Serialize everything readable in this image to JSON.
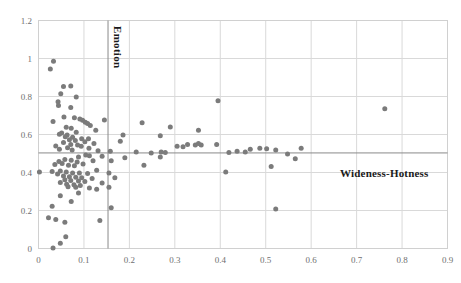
{
  "chart_data": {
    "type": "scatter",
    "title": "",
    "subtitle": "",
    "xlabel": "",
    "ylabel": "",
    "xlim": [
      0,
      0.9
    ],
    "ylim": [
      0,
      1.2
    ],
    "xticks": [
      "0",
      "0.1",
      "0.2",
      "0.3",
      "0.4",
      "0.5",
      "0.6",
      "0.7",
      "0.8",
      "0.9"
    ],
    "xtick_values": [
      0,
      0.1,
      0.2,
      0.3,
      0.4,
      0.5,
      0.6,
      0.7,
      0.8,
      0.9
    ],
    "yticks": [
      "0",
      "0.2",
      "0.4",
      "0.6",
      "0.8",
      "1",
      "1.2"
    ],
    "ytick_values": [
      0,
      0.2,
      0.4,
      0.6,
      0.8,
      1.0,
      1.2
    ],
    "grid": true,
    "legend": false,
    "marker": {
      "shape": "circle",
      "color": "#7b7b7b",
      "size_px": 5
    },
    "annotations": [
      {
        "name": "emotion",
        "text": "Emotion",
        "orientation": "vertical",
        "line": {
          "type": "vline",
          "x": 0.153,
          "color": "#8a8a8a"
        }
      },
      {
        "name": "wideness-hotness",
        "text": "Wideness-Hotness",
        "orientation": "horizontal",
        "line": {
          "type": "hline",
          "y": 0.503,
          "color": "#8a8a8a"
        }
      }
    ],
    "series": [
      {
        "name": "data",
        "points": [
          [
            0.033,
            0.985
          ],
          [
            0.026,
            0.945
          ],
          [
            0.055,
            0.852
          ],
          [
            0.071,
            0.855
          ],
          [
            0.049,
            0.815
          ],
          [
            0.083,
            0.798
          ],
          [
            0.043,
            0.772
          ],
          [
            0.044,
            0.752
          ],
          [
            0.071,
            0.742
          ],
          [
            0.762,
            0.735
          ],
          [
            0.056,
            0.692
          ],
          [
            0.079,
            0.688
          ],
          [
            0.091,
            0.682
          ],
          [
            0.097,
            0.675
          ],
          [
            0.032,
            0.668
          ],
          [
            0.103,
            0.665
          ],
          [
            0.145,
            0.676
          ],
          [
            0.108,
            0.658
          ],
          [
            0.228,
            0.662
          ],
          [
            0.114,
            0.648
          ],
          [
            0.395,
            0.778
          ],
          [
            0.061,
            0.638
          ],
          [
            0.072,
            0.633
          ],
          [
            0.29,
            0.64
          ],
          [
            0.352,
            0.622
          ],
          [
            0.126,
            0.622
          ],
          [
            0.083,
            0.612
          ],
          [
            0.051,
            0.608
          ],
          [
            0.046,
            0.601
          ],
          [
            0.063,
            0.598
          ],
          [
            0.186,
            0.598
          ],
          [
            0.268,
            0.593
          ],
          [
            0.059,
            0.588
          ],
          [
            0.075,
            0.585
          ],
          [
            0.095,
            0.578
          ],
          [
            0.11,
            0.578
          ],
          [
            0.068,
            0.572
          ],
          [
            0.081,
            0.568
          ],
          [
            0.18,
            0.565
          ],
          [
            0.102,
            0.562
          ],
          [
            0.055,
            0.558
          ],
          [
            0.122,
            0.552
          ],
          [
            0.071,
            0.548
          ],
          [
            0.086,
            0.545
          ],
          [
            0.038,
            0.54
          ],
          [
            0.094,
            0.538
          ],
          [
            0.064,
            0.53
          ],
          [
            0.111,
            0.528
          ],
          [
            0.328,
            0.548
          ],
          [
            0.345,
            0.545
          ],
          [
            0.352,
            0.552
          ],
          [
            0.358,
            0.545
          ],
          [
            0.392,
            0.548
          ],
          [
            0.305,
            0.538
          ],
          [
            0.318,
            0.535
          ],
          [
            0.046,
            0.522
          ],
          [
            0.074,
            0.518
          ],
          [
            0.131,
            0.515
          ],
          [
            0.158,
            0.512
          ],
          [
            0.27,
            0.508
          ],
          [
            0.279,
            0.505
          ],
          [
            0.215,
            0.508
          ],
          [
            0.248,
            0.502
          ],
          [
            0.419,
            0.505
          ],
          [
            0.437,
            0.512
          ],
          [
            0.466,
            0.522
          ],
          [
            0.487,
            0.528
          ],
          [
            0.502,
            0.525
          ],
          [
            0.522,
            0.518
          ],
          [
            0.455,
            0.508
          ],
          [
            0.578,
            0.528
          ],
          [
            0.548,
            0.498
          ],
          [
            0.104,
            0.492
          ],
          [
            0.112,
            0.488
          ],
          [
            0.088,
            0.482
          ],
          [
            0.14,
            0.485
          ],
          [
            0.19,
            0.478
          ],
          [
            0.268,
            0.482
          ],
          [
            0.058,
            0.468
          ],
          [
            0.072,
            0.465
          ],
          [
            0.12,
            0.462
          ],
          [
            0.045,
            0.458
          ],
          [
            0.085,
            0.455
          ],
          [
            0.16,
            0.462
          ],
          [
            0.565,
            0.472
          ],
          [
            0.052,
            0.448
          ],
          [
            0.098,
            0.445
          ],
          [
            0.036,
            0.442
          ],
          [
            0.066,
            0.438
          ],
          [
            0.079,
            0.435
          ],
          [
            0.232,
            0.438
          ],
          [
            0.002,
            0.402
          ],
          [
            0.03,
            0.405
          ],
          [
            0.048,
            0.408
          ],
          [
            0.061,
            0.402
          ],
          [
            0.075,
            0.398
          ],
          [
            0.09,
            0.398
          ],
          [
            0.042,
            0.392
          ],
          [
            0.108,
            0.395
          ],
          [
            0.128,
            0.412
          ],
          [
            0.155,
            0.398
          ],
          [
            0.412,
            0.402
          ],
          [
            0.512,
            0.432
          ],
          [
            0.055,
            0.382
          ],
          [
            0.068,
            0.378
          ],
          [
            0.082,
            0.375
          ],
          [
            0.095,
            0.372
          ],
          [
            0.118,
            0.368
          ],
          [
            0.168,
            0.372
          ],
          [
            0.058,
            0.362
          ],
          [
            0.071,
            0.358
          ],
          [
            0.088,
            0.355
          ],
          [
            0.102,
            0.352
          ],
          [
            0.048,
            0.348
          ],
          [
            0.14,
            0.345
          ],
          [
            0.062,
            0.338
          ],
          [
            0.078,
            0.335
          ],
          [
            0.092,
            0.332
          ],
          [
            0.065,
            0.325
          ],
          [
            0.082,
            0.322
          ],
          [
            0.112,
            0.318
          ],
          [
            0.155,
            0.322
          ],
          [
            0.128,
            0.312
          ],
          [
            0.088,
            0.292
          ],
          [
            0.048,
            0.278
          ],
          [
            0.072,
            0.248
          ],
          [
            0.16,
            0.215
          ],
          [
            0.522,
            0.208
          ],
          [
            0.03,
            0.222
          ],
          [
            0.022,
            0.162
          ],
          [
            0.038,
            0.152
          ],
          [
            0.058,
            0.138
          ],
          [
            0.135,
            0.148
          ],
          [
            0.06,
            0.062
          ],
          [
            0.048,
            0.028
          ],
          [
            0.032,
            0.002
          ]
        ]
      }
    ]
  }
}
